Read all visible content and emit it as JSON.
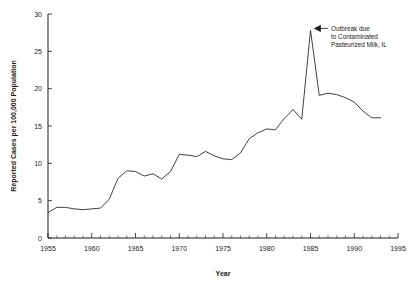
{
  "chart_data": {
    "type": "line",
    "title": "",
    "xlabel": "Year",
    "ylabel": "Reported Cases per 100,000 Population",
    "xlim": [
      1955,
      1995
    ],
    "ylim": [
      0,
      30
    ],
    "grid": false,
    "legend": null,
    "x_major_ticks": [
      1955,
      1960,
      1965,
      1970,
      1975,
      1980,
      1985,
      1990,
      1995
    ],
    "x_tick_labels": [
      "1955",
      "1960",
      "1965",
      "1970",
      "1975",
      "1980",
      "1985",
      "1990",
      "1995"
    ],
    "x_minor_tick_step": 1,
    "y_major_ticks": [
      0,
      5,
      10,
      15,
      20,
      25,
      30
    ],
    "y_tick_labels": [
      "0",
      "5",
      "10",
      "15",
      "20",
      "25",
      "30"
    ],
    "x": [
      1955,
      1956,
      1957,
      1958,
      1959,
      1960,
      1961,
      1962,
      1963,
      1964,
      1965,
      1966,
      1967,
      1968,
      1969,
      1970,
      1971,
      1972,
      1973,
      1974,
      1975,
      1976,
      1977,
      1978,
      1979,
      1980,
      1981,
      1982,
      1983,
      1984,
      1985,
      1986,
      1987,
      1988,
      1989,
      1990,
      1991,
      1992,
      1993
    ],
    "values": [
      3.4,
      4.1,
      4.1,
      3.9,
      3.8,
      3.9,
      4.0,
      5.2,
      8.0,
      9.0,
      8.9,
      8.3,
      8.6,
      7.9,
      8.9,
      11.2,
      11.1,
      10.9,
      11.6,
      11.0,
      10.6,
      10.5,
      11.4,
      13.3,
      14.1,
      14.6,
      14.5,
      16.0,
      17.2,
      15.9,
      27.8,
      19.1,
      19.4,
      19.2,
      18.8,
      18.2,
      17.0,
      16.1,
      16.1
    ],
    "annotations": [
      {
        "name": "outbreak-annotation",
        "lines": [
          "Outbreak due",
          "to Contaminated",
          "Pasteurized Milk, IL"
        ],
        "points_to_year": 1985,
        "points_to_value": 27.8
      }
    ],
    "line_color": "#2b2b2b",
    "axis_color": "#1a1a1a",
    "background": "#ffffff"
  }
}
